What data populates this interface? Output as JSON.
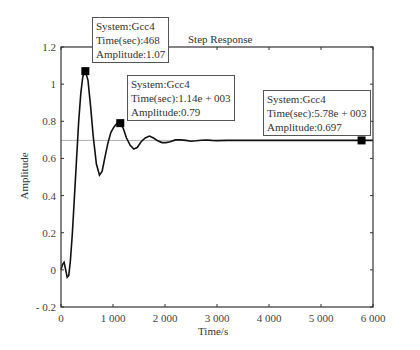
{
  "chart_data": {
    "type": "line",
    "title": "Step Response",
    "xlabel": "Time/s",
    "ylabel": "Amplitude",
    "xlim": [
      0,
      6000
    ],
    "ylim": [
      -0.2,
      1.2
    ],
    "xticks": [
      0,
      1000,
      2000,
      3000,
      4000,
      5000,
      6000
    ],
    "xtick_labels": [
      "0",
      "1 000",
      "2 000",
      "3 000",
      "4 000",
      "5 000",
      "6 000"
    ],
    "yticks": [
      -0.2,
      0,
      0.2,
      0.4,
      0.6,
      0.8,
      1,
      1.2
    ],
    "ytick_labels": [
      "- 0.2",
      "0",
      "0.2",
      "0.4",
      "0.6",
      "0.8",
      "1",
      "1.2"
    ],
    "grid": false,
    "reference_line": 0.697,
    "series": [
      {
        "name": "Gcc4",
        "x": [
          0,
          30,
          60,
          90,
          120,
          150,
          180,
          220,
          260,
          300,
          340,
          380,
          420,
          468,
          520,
          570,
          620,
          680,
          740,
          790,
          840,
          900,
          960,
          1020,
          1080,
          1140,
          1200,
          1260,
          1330,
          1400,
          1470,
          1540,
          1620,
          1700,
          1780,
          1860,
          1940,
          2020,
          2100,
          2200,
          2300,
          2400,
          2500,
          2600,
          2700,
          2800,
          2900,
          3000,
          3200,
          3400,
          3600,
          3800,
          4000,
          4500,
          5000,
          5500,
          5780,
          6000
        ],
        "y": [
          0,
          0.03,
          0.04,
          0.0,
          -0.04,
          -0.03,
          0.05,
          0.2,
          0.4,
          0.6,
          0.8,
          0.95,
          1.04,
          1.07,
          1.02,
          0.88,
          0.72,
          0.57,
          0.51,
          0.53,
          0.6,
          0.68,
          0.74,
          0.77,
          0.79,
          0.79,
          0.76,
          0.71,
          0.67,
          0.65,
          0.66,
          0.69,
          0.71,
          0.72,
          0.71,
          0.695,
          0.685,
          0.685,
          0.69,
          0.7,
          0.7,
          0.697,
          0.693,
          0.695,
          0.698,
          0.699,
          0.697,
          0.696,
          0.697,
          0.698,
          0.697,
          0.697,
          0.697,
          0.697,
          0.697,
          0.697,
          0.697,
          0.697
        ]
      }
    ],
    "data_tips": [
      {
        "system": "System:Gcc4",
        "time": "Time(sec):468",
        "amplitude": "Amplitude:1.07",
        "x": 468,
        "y": 1.07
      },
      {
        "system": "System:Gcc4",
        "time": "Time(sec):1.14e + 003",
        "amplitude": "Amplitude:0.79",
        "x": 1140,
        "y": 0.79
      },
      {
        "system": "System:Gcc4",
        "time": "Time(sec):5.78e + 003",
        "amplitude": "Amplitude:0.697",
        "x": 5780,
        "y": 0.697
      }
    ]
  },
  "colors": {
    "line": "#111111",
    "axis": "#333333",
    "reference": "#999999",
    "marker": "#000000"
  }
}
